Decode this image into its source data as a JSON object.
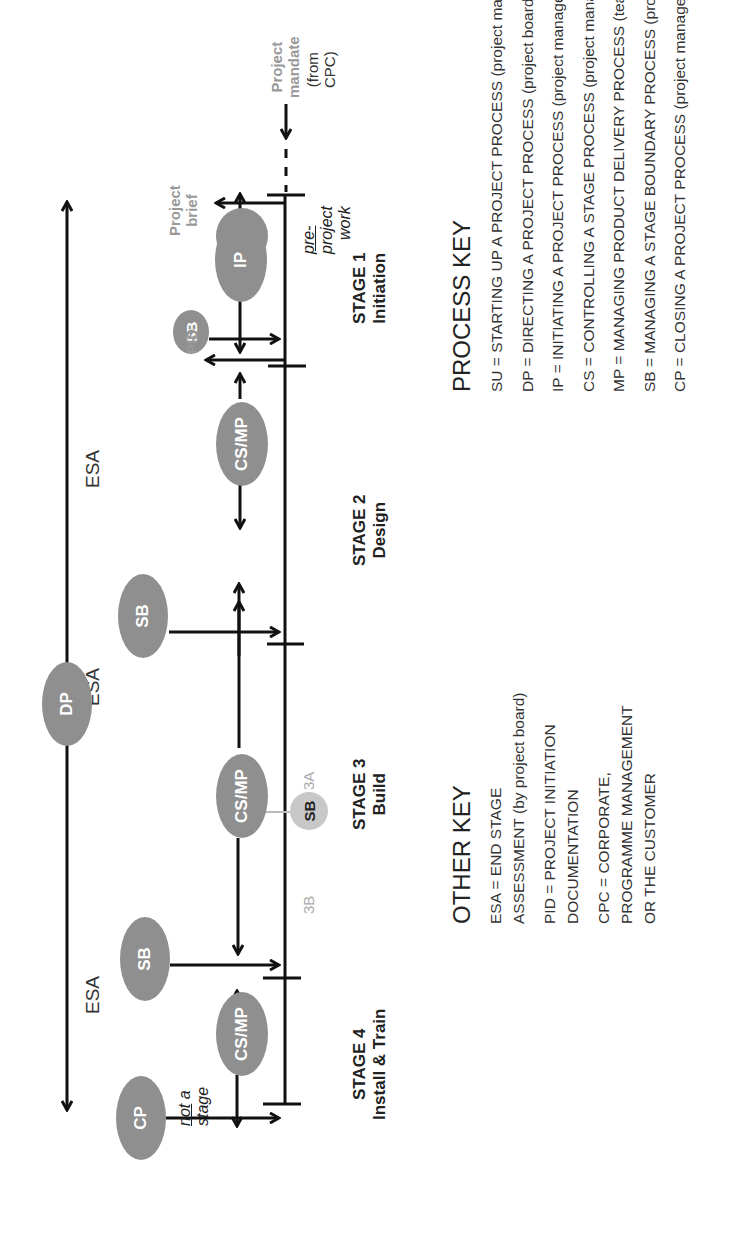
{
  "diagram": {
    "orientation": "rotated 90° counter-clockwise",
    "top_arrow_label": "ESA",
    "esa_labels": [
      "ESA",
      "ESA",
      "ESA"
    ],
    "bubbles": {
      "su": "SU",
      "ip": "IP",
      "sb_stage1": "SB",
      "cs_mp_stage2": "CS/MP",
      "sb_stage2": "SB",
      "dp": "DP",
      "cs_mp_stage3": "CS/MP",
      "sb_stage3_mid": "SB",
      "sb_stage3": "SB",
      "cs_mp_stage4": "CS/MP",
      "cp": "CP"
    },
    "labels": {
      "project_mandate": [
        "Project",
        "mandate"
      ],
      "from_cpc": [
        "(from",
        "CPC)"
      ],
      "pre_project_work": {
        "underlined": "pre-",
        "rest": [
          "project",
          "work"
        ]
      },
      "project_brief": [
        "Project",
        "brief"
      ],
      "pid": "PID",
      "sub_stage_3a": "3A",
      "sub_stage_3b": "3B",
      "not_a_stage": {
        "underlined": "not",
        "rest_line1": " a",
        "line2": "stage"
      }
    },
    "stages": [
      {
        "title": "STAGE 1",
        "subtitle": "Initiation"
      },
      {
        "title": "STAGE 2",
        "subtitle": "Design"
      },
      {
        "title": "STAGE 3",
        "subtitle": "Build"
      },
      {
        "title": "STAGE 4",
        "subtitle": "Install & Train"
      }
    ],
    "colors": {
      "bubble_dark": "#8f8f8f",
      "bubble_light": "#c8c8c8",
      "line": "#111111",
      "grey_text": "#999999"
    }
  },
  "process_key": {
    "title": "PROCESS KEY",
    "items": [
      "SU = STARTING UP A PROJECT PROCESS (project manager)",
      "DP = DIRECTING A PROJECT PROCESS (project board)",
      "IP = INITIATING A PROJECT PROCESS (project manager)",
      "CS = CONTROLLING A STAGE PROCESS (project manager)",
      "MP = MANAGING PRODUCT DELIVERY PROCESS (team manager)",
      "SB = MANAGING A STAGE BOUNDARY PROCESS (project manager)",
      "CP = CLOSING A PROJECT PROCESS (project manager)"
    ]
  },
  "other_key": {
    "title": "OTHER KEY",
    "entries": [
      {
        "lines": [
          "ESA = END STAGE",
          "ASSESSMENT (by project board)"
        ]
      },
      {
        "lines": [
          "PID = PROJECT INITIATION",
          "DOCUMENTATION"
        ]
      },
      {
        "lines": [
          "CPC = CORPORATE,",
          "PROGRAMME MANAGEMENT",
          "OR THE CUSTOMER"
        ]
      }
    ]
  }
}
